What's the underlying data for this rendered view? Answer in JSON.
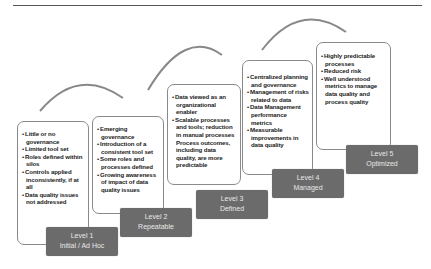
{
  "diagram": {
    "type": "maturity-model",
    "levels": [
      {
        "level": "Level 1",
        "name": "Initial / Ad Hoc",
        "bullets": [
          "Little or no governance",
          "Limited tool set",
          "Roles defined within silos",
          "Controls applied inconsistently, if at all",
          "Data quality issues not addressed"
        ]
      },
      {
        "level": "Level 2",
        "name": "Repeatable",
        "bullets": [
          "Emerging governance",
          "Introduction of a consistent tool set",
          "Some roles and processes defined",
          "Growing awareness of impact of data quality issues"
        ]
      },
      {
        "level": "Level 3",
        "name": "Defined",
        "bullets": [
          "Data viewed as an organizational enabler",
          "Scalable processes and tools; reduction in manual processes Process outcomes, including data quality, are more predictable"
        ]
      },
      {
        "level": "Level 4",
        "name": "Managed",
        "bullets": [
          "Centralized planning and governance",
          "Management of risks related to data",
          "Data Management performance metrics",
          "Measurable improvements in data quality"
        ]
      },
      {
        "level": "Level 5",
        "name": "Optimized",
        "bullets": [
          "Highly predictable processes",
          "Reduced risk",
          "Well understood metrics to manage data quality and process quality"
        ]
      }
    ],
    "colors": {
      "label_bg": "#6b6b6b",
      "label_text": "#e8e8e8",
      "box_border": "#8a8a8a",
      "arc": "#888888"
    }
  }
}
